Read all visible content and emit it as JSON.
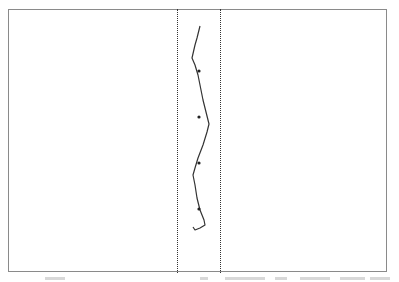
{
  "figure": {
    "frame": {
      "left": 8,
      "top": 9,
      "right": 388,
      "bottom": 273,
      "stroke": "#8a8a8a"
    },
    "boundary_lines": [
      {
        "name": "left-boundary",
        "x": 177
      },
      {
        "name": "right-boundary",
        "x": 220
      }
    ],
    "trace_points": [
      [
        200,
        26
      ],
      [
        197,
        38
      ],
      [
        195,
        45
      ],
      [
        192,
        58
      ],
      [
        195,
        65
      ],
      [
        198,
        75
      ],
      [
        200,
        85
      ],
      [
        203,
        100
      ],
      [
        206,
        112
      ],
      [
        209,
        124
      ],
      [
        207,
        132
      ],
      [
        203,
        145
      ],
      [
        198,
        158
      ],
      [
        195,
        168
      ],
      [
        193,
        175
      ],
      [
        195,
        185
      ],
      [
        197,
        198
      ],
      [
        200,
        210
      ],
      [
        204,
        220
      ],
      [
        205,
        225
      ],
      [
        200,
        228
      ],
      [
        195,
        230
      ],
      [
        193,
        227
      ]
    ],
    "markers": [
      {
        "x": 199,
        "y": 71
      },
      {
        "x": 199,
        "y": 117
      },
      {
        "x": 199,
        "y": 163
      },
      {
        "x": 199,
        "y": 209
      }
    ],
    "trace_color": "#333333",
    "marker_color": "#222222"
  },
  "caption": {
    "visible_text": "",
    "note_fragments": [
      {
        "x": 45,
        "w": 20
      },
      {
        "x": 200,
        "w": 8
      },
      {
        "x": 225,
        "w": 40
      },
      {
        "x": 275,
        "w": 12
      },
      {
        "x": 300,
        "w": 30
      },
      {
        "x": 340,
        "w": 25
      },
      {
        "x": 370,
        "w": 20
      }
    ]
  }
}
